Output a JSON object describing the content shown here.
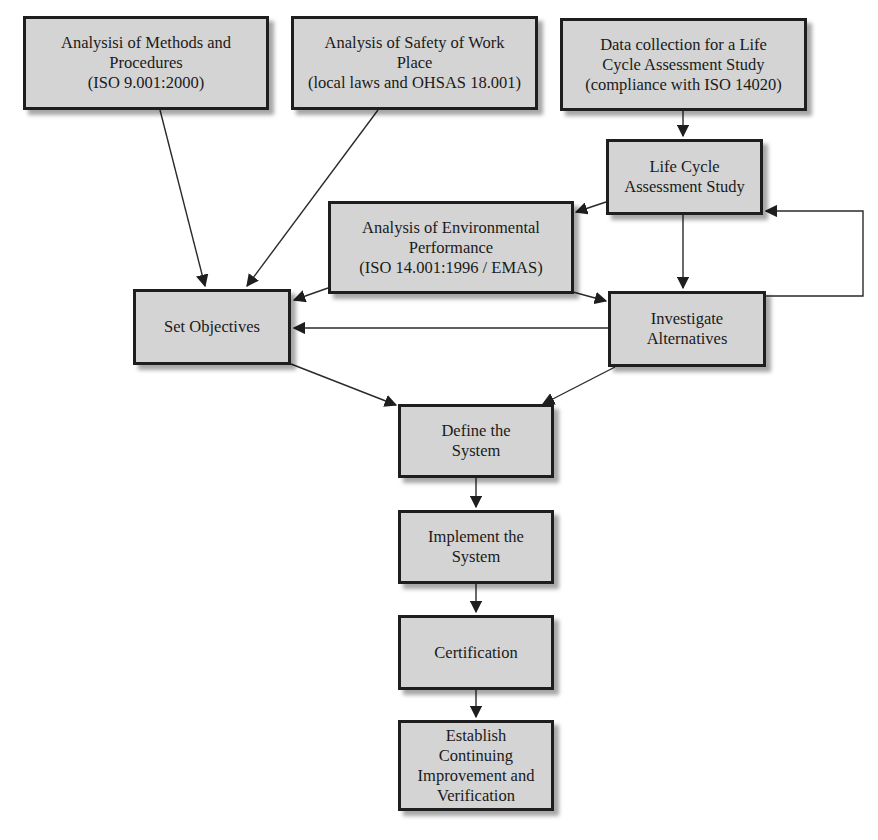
{
  "diagram": {
    "title": "",
    "nodes": [
      {
        "id": "methods",
        "label": "Analysisi of Methods and\nProcedures\n(ISO 9.001:2000)"
      },
      {
        "id": "safety",
        "label": "Analysis of Safety of Work\nPlace\n(local laws and OHSAS 18.001)"
      },
      {
        "id": "datacollection",
        "label": "Data collection for a Life\nCycle Assessment Study\n(compliance with ISO 14020)"
      },
      {
        "id": "lca",
        "label": "Life Cycle\nAssessment Study"
      },
      {
        "id": "envperf",
        "label": "Analysis of Environmental\nPerformance\n(ISO 14.001:1996 / EMAS)"
      },
      {
        "id": "objectives",
        "label": "Set Objectives"
      },
      {
        "id": "alternatives",
        "label": "Investigate\nAlternatives"
      },
      {
        "id": "define",
        "label": "Define the\nSystem"
      },
      {
        "id": "implement",
        "label": "Implement the\nSystem"
      },
      {
        "id": "certification",
        "label": "Certification"
      },
      {
        "id": "improvement",
        "label": "Establish\nContinuing\nImprovement and\nVerification"
      }
    ],
    "edges": [
      {
        "from": "methods",
        "to": "objectives"
      },
      {
        "from": "safety",
        "to": "objectives"
      },
      {
        "from": "datacollection",
        "to": "lca"
      },
      {
        "from": "lca",
        "to": "envperf"
      },
      {
        "from": "lca",
        "to": "alternatives"
      },
      {
        "from": "alternatives",
        "to": "lca",
        "type": "feedback-loop"
      },
      {
        "from": "envperf",
        "to": "objectives"
      },
      {
        "from": "envperf",
        "to": "alternatives"
      },
      {
        "from": "alternatives",
        "to": "objectives"
      },
      {
        "from": "objectives",
        "to": "define"
      },
      {
        "from": "alternatives",
        "to": "define"
      },
      {
        "from": "define",
        "to": "implement"
      },
      {
        "from": "implement",
        "to": "certification"
      },
      {
        "from": "certification",
        "to": "improvement"
      }
    ],
    "colors": {
      "box_fill": "#d4d4d4",
      "box_border": "#1e1e1e",
      "line": "#2a2a2a",
      "text": "#1a1a1a"
    }
  }
}
